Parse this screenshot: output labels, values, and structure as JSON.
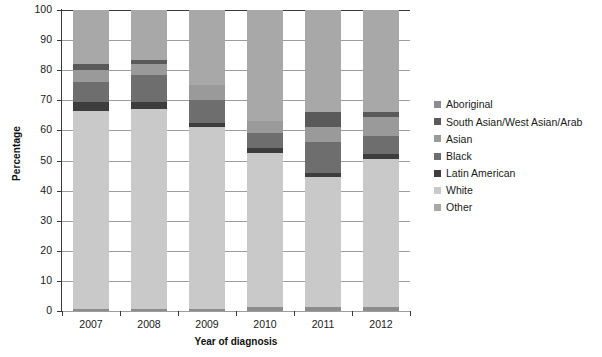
{
  "chart_data": {
    "type": "bar",
    "stacked": true,
    "stack_mode": "percent",
    "title": "",
    "xlabel": "Year of diagnosis",
    "ylabel": "Percentage",
    "categories": [
      "2007",
      "2008",
      "2009",
      "2010",
      "2011",
      "2012"
    ],
    "ylim": [
      0,
      100
    ],
    "yticks": [
      0,
      10,
      20,
      30,
      40,
      50,
      60,
      70,
      80,
      90,
      100
    ],
    "ytick_labels": [
      "0",
      "10",
      "20",
      "30",
      "40",
      "50",
      "60",
      "70",
      "80",
      "90",
      "100"
    ],
    "grid": true,
    "grid_axis": "y",
    "legend_position": "right",
    "series": [
      {
        "name": "Aboriginal",
        "color": "#8c8c8c",
        "values": [
          0.8,
          0.8,
          0.8,
          1.2,
          1.2,
          1.2
        ]
      },
      {
        "name": "White",
        "color": "#c9c9c9",
        "values": [
          65.7,
          66.2,
          60.2,
          51.3,
          43.3,
          49.3
        ]
      },
      {
        "name": "Latin American",
        "color": "#3d3d3d",
        "values": [
          3.0,
          2.5,
          1.5,
          1.5,
          1.5,
          1.5
        ]
      },
      {
        "name": "Black",
        "color": "#6e6e6e",
        "values": [
          6.5,
          9.0,
          7.5,
          5.0,
          10.0,
          6.0
        ]
      },
      {
        "name": "Asian",
        "color": "#9a9a9a",
        "values": [
          4.0,
          3.5,
          5.0,
          4.0,
          5.0,
          6.5
        ]
      },
      {
        "name": "South Asian/West Asian/Arab",
        "color": "#5a5a5a",
        "values": [
          2.0,
          1.5,
          0.0,
          0.0,
          5.0,
          1.5
        ]
      },
      {
        "name": "Other",
        "color": "#a8a8a8",
        "values": [
          18.0,
          16.5,
          25.0,
          37.0,
          34.0,
          34.0
        ]
      }
    ],
    "legend_entries": [
      {
        "label": "Aboriginal",
        "color": "#8c8c8c"
      },
      {
        "label": "South Asian/West Asian/Arab",
        "color": "#5a5a5a"
      },
      {
        "label": "Asian",
        "color": "#9a9a9a"
      },
      {
        "label": "Black",
        "color": "#6e6e6e"
      },
      {
        "label": "Latin American",
        "color": "#3d3d3d"
      },
      {
        "label": "White",
        "color": "#c9c9c9"
      },
      {
        "label": "Other",
        "color": "#a8a8a8"
      }
    ]
  },
  "axis": {
    "y_title": "Percentage",
    "x_title": "Year of diagnosis"
  }
}
